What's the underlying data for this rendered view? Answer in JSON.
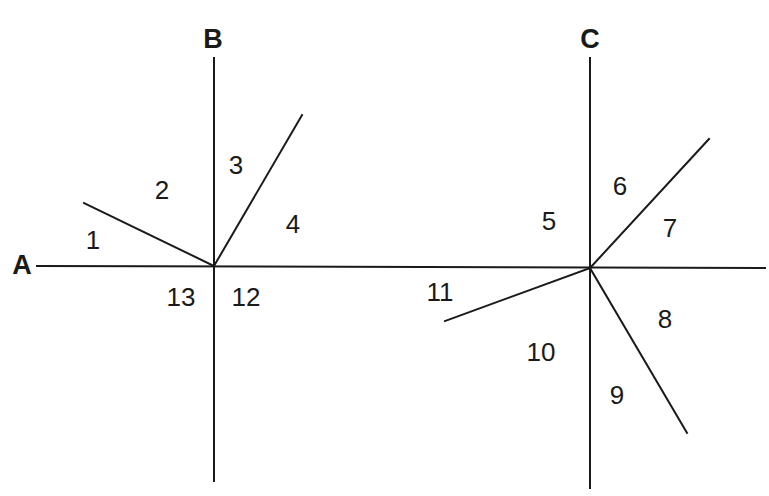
{
  "figure": {
    "type": "geometry-diagram",
    "background_color": "#ffffff",
    "stroke_color": "#1a1a1a",
    "stroke_width": 2,
    "width": 769,
    "height": 496
  },
  "vertices": [
    {
      "name": "B",
      "x": 214,
      "y": 266
    },
    {
      "name": "C",
      "x": 590,
      "y": 268
    }
  ],
  "point_labels": [
    {
      "id": "label-A",
      "text": "A",
      "x": 22,
      "y": 265,
      "bold": true,
      "size": 27
    },
    {
      "id": "label-B",
      "text": "B",
      "x": 213,
      "y": 39,
      "bold": true,
      "size": 27
    },
    {
      "id": "label-C",
      "text": "C",
      "x": 590,
      "y": 39,
      "bold": true,
      "size": 27
    }
  ],
  "lines": [
    {
      "id": "transversal-A",
      "x1": 37,
      "y1": 266,
      "x2": 765,
      "y2": 268
    },
    {
      "id": "vertical-through-B",
      "x1": 214,
      "y1": 58,
      "x2": 214,
      "y2": 481
    },
    {
      "id": "ray-B-upper-left",
      "x1": 214,
      "y1": 266,
      "x2": 84,
      "y2": 203
    },
    {
      "id": "ray-B-upper-right",
      "x1": 214,
      "y1": 266,
      "x2": 302,
      "y2": 115
    },
    {
      "id": "vertical-through-C",
      "x1": 590,
      "y1": 58,
      "x2": 590,
      "y2": 488
    },
    {
      "id": "ray-C-upper-right",
      "x1": 590,
      "y1": 268,
      "x2": 709,
      "y2": 139
    },
    {
      "id": "ray-C-lower-right",
      "x1": 590,
      "y1": 268,
      "x2": 687,
      "y2": 433
    },
    {
      "id": "ray-C-lower-left",
      "x1": 590,
      "y1": 268,
      "x2": 445,
      "y2": 321
    }
  ],
  "angle_labels": [
    {
      "id": "angle-1",
      "text": "1",
      "x": 93,
      "y": 240
    },
    {
      "id": "angle-2",
      "text": "2",
      "x": 162,
      "y": 190
    },
    {
      "id": "angle-3",
      "text": "3",
      "x": 236,
      "y": 165
    },
    {
      "id": "angle-4",
      "text": "4",
      "x": 293,
      "y": 224
    },
    {
      "id": "angle-5",
      "text": "5",
      "x": 549,
      "y": 221
    },
    {
      "id": "angle-6",
      "text": "6",
      "x": 620,
      "y": 186
    },
    {
      "id": "angle-7",
      "text": "7",
      "x": 670,
      "y": 228
    },
    {
      "id": "angle-8",
      "text": "8",
      "x": 665,
      "y": 319
    },
    {
      "id": "angle-9",
      "text": "9",
      "x": 617,
      "y": 395
    },
    {
      "id": "angle-10",
      "text": "10",
      "x": 541,
      "y": 352
    },
    {
      "id": "angle-11",
      "text": "11",
      "x": 440,
      "y": 292
    },
    {
      "id": "angle-12",
      "text": "12",
      "x": 246,
      "y": 297
    },
    {
      "id": "angle-13",
      "text": "13",
      "x": 181,
      "y": 297
    }
  ]
}
